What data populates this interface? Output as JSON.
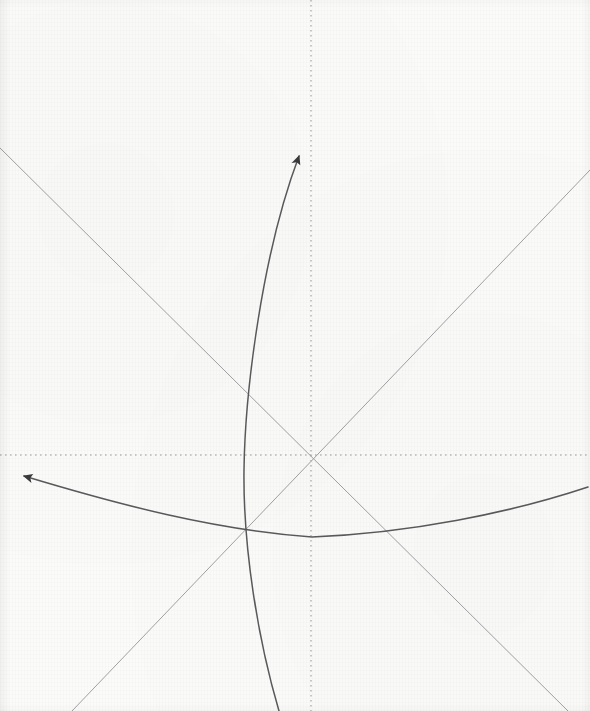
{
  "figure": {
    "kind": "hand-drawn-geometry-sketch",
    "title": "",
    "background_color": "#fbfbfa",
    "canvas": {
      "width": 590,
      "height": 711
    },
    "origin": {
      "x": 311,
      "y": 455,
      "label": ""
    },
    "axes": {
      "style": "dotted",
      "color": "#9a9a9a",
      "dash": "1.6 3.4",
      "stroke_width": 1.05,
      "horizontal": {
        "name": "horizontal-axis",
        "y": 455,
        "x_start": 0,
        "x_end": 590
      },
      "vertical": {
        "name": "vertical-axis",
        "x": 311,
        "y_start": 0,
        "y_end": 711
      }
    },
    "straight_lines": [
      {
        "name": "descending-diagonal",
        "color": "#a2a2a4",
        "stroke_width": 1.0,
        "from": {
          "x": -2,
          "y": 146
        },
        "to": {
          "x": 568,
          "y": 711
        },
        "note": "passes through origin, slope down-right"
      },
      {
        "name": "ascending-diagonal",
        "color": "#a2a2a4",
        "stroke_width": 1.0,
        "from": {
          "x": 72,
          "y": 711
        },
        "to": {
          "x": 590,
          "y": 170
        },
        "note": "passes through origin, slope up-right"
      }
    ],
    "curves": [
      {
        "name": "rising-curve-with-arrow",
        "color": "#5a5a5c",
        "stroke_width": 1.5,
        "arrow": {
          "present": true,
          "at": "end",
          "tip": {
            "x": 302,
            "y": 147
          },
          "direction": "up-right"
        },
        "path": "M 279,711 C 258,640 243,548 244,470 C 245,392 262,254 299,156",
        "note": "steep concave-right curve sweeping from bottom up to arrow near vertical axis"
      },
      {
        "name": "shallow-curve-with-arrow",
        "color": "#5a5a5c",
        "stroke_width": 1.5,
        "arrow": {
          "present": true,
          "at": "start",
          "tip": {
            "x": 17,
            "y": 470
          },
          "direction": "left-up"
        },
        "path": "M 24,476 C 120,505 215,530 312,537 C 410,533 510,513 588,487",
        "note": "shallow concave-up curve, vertex near x=312 y=537, rising to both edges"
      }
    ],
    "intersections": [
      {
        "name": "origin-intersection",
        "x": 311,
        "y": 455
      },
      {
        "name": "rising-curve-x-horizontal-axis",
        "x": 244,
        "y": 455
      },
      {
        "name": "rising-curve-x-descending-diagonal",
        "x": 240,
        "y": 383
      },
      {
        "name": "rising-curve-x-shallow-curve",
        "x": 241,
        "y": 527
      },
      {
        "name": "shallow-curve-x-ascending-diagonal",
        "x": 234,
        "y": 529
      },
      {
        "name": "shallow-curve-x-descending-diagonal",
        "x": 390,
        "y": 534
      }
    ]
  }
}
